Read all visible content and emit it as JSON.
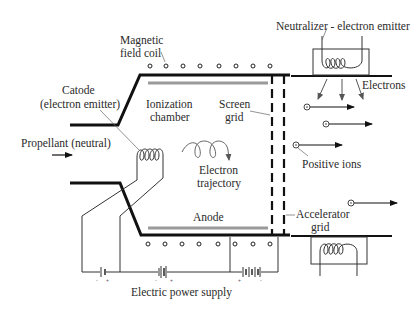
{
  "diagram": {
    "labels": {
      "magnetic_coil_1": "Magnetic",
      "magnetic_coil_2": "field coil",
      "neutralizer": "Neutralizer - electron emitter",
      "catode_1": "Catode",
      "catode_2": "(electron emitter)",
      "ionization_1": "Ionization",
      "ionization_2": "chamber",
      "screen_grid_1": "Screen",
      "screen_grid_2": "grid",
      "electrons": "Electrons",
      "propellant": "Propellant (neutral)",
      "positive_ions": "Positive ions",
      "electron_traj_1": "Electron",
      "electron_traj_2": "trajectory",
      "anode": "Anode",
      "accelerator_1": "Accelerator",
      "accelerator_2": "grid",
      "power_supply": "Electric power supply"
    },
    "colors": {
      "line": "#111111",
      "thin_line": "#444444",
      "electrode_gray": "#9a9a9a"
    }
  }
}
